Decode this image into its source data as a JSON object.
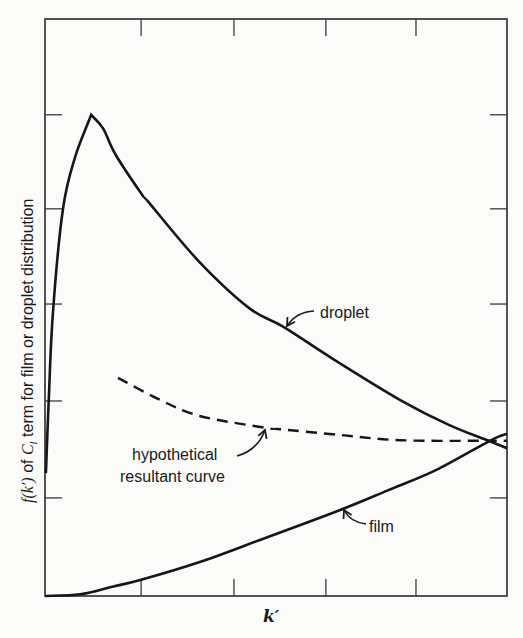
{
  "chart_data": {
    "type": "line",
    "title": "",
    "xlabel": "k′",
    "ylabel": "f(k′) of C_l term for film or droplet distribution",
    "ylabel_parts": {
      "f": "f(k′)",
      "of": " of ",
      "C": "C",
      "sub": "l",
      "rest": " term for film or droplet distribution"
    },
    "xlim": [
      0,
      10
    ],
    "ylim": [
      0,
      10
    ],
    "tick_labels": "none",
    "x_ticks": [
      2.08,
      4.09,
      6.08,
      8.03
    ],
    "y_ticks": [
      1.7,
      3.38,
      5.06,
      6.71,
      8.34
    ],
    "grid": false,
    "legend": "none (curves labelled with annotation arrows)",
    "series": [
      {
        "name": "droplet",
        "style": "solid",
        "x": [
          0.02,
          0.08,
          0.17,
          0.39,
          0.65,
          1.0,
          1.26,
          1.52,
          2.08,
          2.26,
          3.33,
          4.42,
          5.17,
          6.39,
          7.68,
          8.73,
          9.6,
          10.0
        ],
        "y": [
          2.13,
          3.38,
          4.9,
          6.71,
          7.6,
          8.34,
          8.1,
          7.66,
          6.98,
          6.81,
          5.8,
          4.99,
          4.66,
          4.03,
          3.4,
          2.97,
          2.69,
          2.56
        ]
      },
      {
        "name": "film",
        "style": "solid",
        "x": [
          0.0,
          0.76,
          1.5,
          2.08,
          3.35,
          4.65,
          6.39,
          7.42,
          8.46,
          9.63,
          10.0
        ],
        "y": [
          0.0,
          0.03,
          0.17,
          0.28,
          0.59,
          0.97,
          1.49,
          1.83,
          2.18,
          2.69,
          2.81
        ]
      },
      {
        "name": "hypothetical resultant curve",
        "style": "dashed",
        "x": [
          1.58,
          2.49,
          3.35,
          4.81,
          5.09,
          6.39,
          7.68,
          9.63,
          10.0
        ],
        "y": [
          3.78,
          3.4,
          3.12,
          2.91,
          2.89,
          2.79,
          2.7,
          2.69,
          2.69
        ]
      }
    ],
    "annotations": [
      {
        "text": "droplet",
        "points_to": "droplet curve near k′≈5.2"
      },
      {
        "text": "film",
        "points_to": "film curve near k′≈6.4"
      },
      {
        "lines": [
          "hypothetical",
          "resultant curve"
        ],
        "points_to": "dashed curve near k′≈4.8"
      }
    ]
  },
  "labels": {
    "droplet": "droplet",
    "film": "film",
    "hyp1": "hypothetical",
    "hyp2": "resultant curve",
    "xaxis": "k′"
  }
}
